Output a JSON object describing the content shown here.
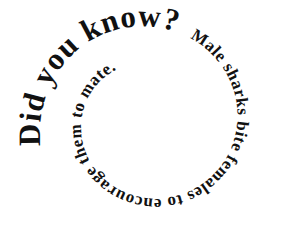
{
  "graphic": {
    "type": "spiral-text",
    "background": "#ffffff",
    "text_color": "#111111",
    "heading": "Did you know?",
    "fact": "Male sharks bite females to encourage them to mate."
  }
}
